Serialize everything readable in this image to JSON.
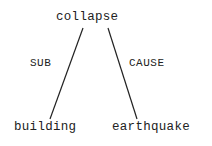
{
  "tree": {
    "root": {
      "label": "collapse"
    },
    "children": [
      {
        "label": "building",
        "relation": "SUB"
      },
      {
        "label": "earthquake",
        "relation": "CAUSE"
      }
    ]
  }
}
